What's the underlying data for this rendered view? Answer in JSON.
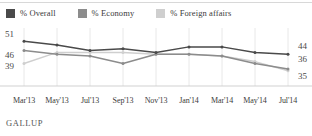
{
  "legend": {
    "items": [
      {
        "label": "% Overall",
        "color": "#4a4a4a",
        "swatch_name": "legend-swatch-overall"
      },
      {
        "label": "% Economy",
        "color": "#8c8c8c",
        "swatch_name": "legend-swatch-economy"
      },
      {
        "label": "% Foreign affairs",
        "color": "#cfcfcf",
        "swatch_name": "legend-swatch-foreign-affairs"
      }
    ]
  },
  "footer": {
    "source": "GALLUP"
  },
  "axis": {
    "left_labels": [
      "51",
      "46",
      "39"
    ],
    "right_labels": [
      "44",
      "36",
      "35"
    ]
  },
  "chart_data": {
    "type": "line",
    "title": "",
    "subtitle": "",
    "xlabel": "",
    "ylabel": "",
    "grid": true,
    "legend_position": "top-left",
    "ylim": [
      30,
      55
    ],
    "categories": [
      "Mar'13",
      "May'13",
      "Jul'13",
      "Sep'13",
      "Nov'13",
      "Jan'14",
      "Mar'14",
      "May'14",
      "Jul'14"
    ],
    "series": [
      {
        "name": "% Overall",
        "color": "#4a4a4a",
        "values": [
          51,
          49,
          46,
          47,
          45,
          48,
          48,
          45,
          44
        ],
        "start_label": "51",
        "end_label": "44"
      },
      {
        "name": "% Economy",
        "color": "#8c8c8c",
        "values": [
          46,
          44,
          43,
          39,
          44,
          44,
          43,
          39,
          36
        ],
        "start_label": "46",
        "end_label": "36"
      },
      {
        "name": "% Foreign affairs",
        "color": "#cfcfcf",
        "values": [
          39,
          45,
          45,
          45,
          44,
          44,
          43,
          40,
          35
        ],
        "start_label": "39",
        "end_label": "35"
      }
    ]
  }
}
